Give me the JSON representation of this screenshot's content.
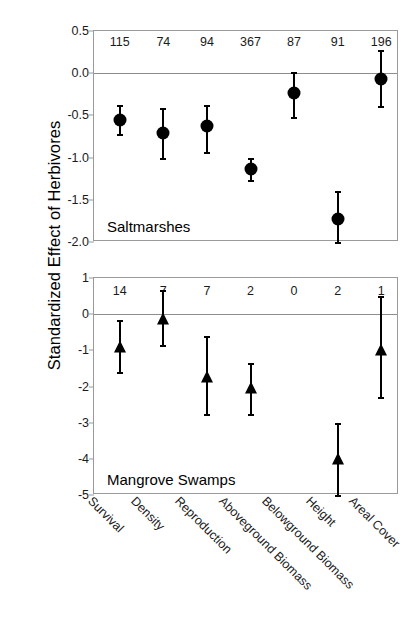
{
  "figure": {
    "y_axis_title": "Standardized Effect of Herbivores"
  },
  "chart_data": {
    "type": "scatter",
    "title": "Standardized Effect of Herbivores",
    "xlabel": "",
    "ylabel": "Standardized Effect of Herbivores",
    "grid": false,
    "legend": "none",
    "categories": [
      "Survival",
      "Density",
      "Reproduction",
      "Aboveground Biomass",
      "Belowground Biomass",
      "Height",
      "Areal Cover"
    ],
    "panels": [
      {
        "name": "Saltmarshes",
        "caption": "Saltmarshes",
        "marker": "circle",
        "ylim": [
          -2.0,
          0.5
        ],
        "yticks": [
          "0.5",
          "0.0",
          "-0.5",
          "-1.0",
          "-1.5",
          "-2.0"
        ],
        "ytick_values": [
          0.5,
          0.0,
          -0.5,
          -1.0,
          -1.5,
          -2.0
        ],
        "zero_line": 0.0,
        "sample_sizes": [
          "115",
          "74",
          "94",
          "367",
          "87",
          "91",
          "196"
        ],
        "points": [
          {
            "category": "Survival",
            "value": -0.55,
            "low": -0.72,
            "high": -0.38,
            "n": "115"
          },
          {
            "category": "Density",
            "value": -0.71,
            "low": -1.01,
            "high": -0.41,
            "n": "74"
          },
          {
            "category": "Reproduction",
            "value": -0.63,
            "low": -0.93,
            "high": -0.38,
            "n": "94"
          },
          {
            "category": "Aboveground Biomass",
            "value": -1.13,
            "low": -1.26,
            "high": -1.01,
            "n": "367"
          },
          {
            "category": "Belowground Biomass",
            "value": -0.24,
            "low": -0.52,
            "high": 0.02,
            "n": "87"
          },
          {
            "category": "Height",
            "value": -1.73,
            "low": -2.0,
            "high": -1.4,
            "n": "91"
          },
          {
            "category": "Areal Cover",
            "value": -0.07,
            "low": -0.39,
            "high": 0.27,
            "n": "196"
          }
        ]
      },
      {
        "name": "Mangrove Swamps",
        "caption": "Mangrove Swamps",
        "marker": "triangle",
        "ylim": [
          -5,
          1
        ],
        "yticks": [
          "1",
          "0",
          "-1",
          "-2",
          "-3",
          "-4",
          "-5"
        ],
        "ytick_values": [
          1,
          0,
          -1,
          -2,
          -3,
          -4,
          -5
        ],
        "zero_line": 0,
        "sample_sizes": [
          "14",
          "7",
          "7",
          "2",
          "0",
          "2",
          "1"
        ],
        "points": [
          {
            "category": "Survival",
            "value": -0.9,
            "low": -1.6,
            "high": -0.15,
            "n": "14"
          },
          {
            "category": "Density",
            "value": -0.12,
            "low": -0.85,
            "high": 0.68,
            "n": "7"
          },
          {
            "category": "Reproduction",
            "value": -1.75,
            "low": -2.75,
            "high": -0.6,
            "n": "7"
          },
          {
            "category": "Aboveground Biomass",
            "value": -2.05,
            "low": -2.75,
            "high": -1.35,
            "n": "2"
          },
          {
            "category": "Belowground Biomass",
            "value": null,
            "low": null,
            "high": null,
            "n": "0"
          },
          {
            "category": "Height",
            "value": -4.0,
            "low": -5.0,
            "high": -3.0,
            "n": "2"
          },
          {
            "category": "Areal Cover",
            "value": -1.0,
            "low": -2.3,
            "high": 0.5,
            "n": "1"
          }
        ]
      }
    ]
  }
}
